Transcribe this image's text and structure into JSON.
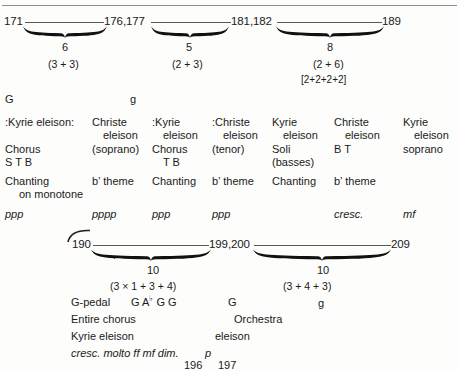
{
  "figure": {
    "type": "musical-form-analysis-chart",
    "top_rule": true
  },
  "system1": {
    "measure_numbers": [
      "171",
      "176,177",
      "181,182",
      "189"
    ],
    "groups": [
      {
        "count": "6",
        "subdivision": "(3 + 3)",
        "bracket": ""
      },
      {
        "count": "5",
        "subdivision": "(2 + 3)",
        "bracket": ""
      },
      {
        "count": "8",
        "subdivision": "(2 + 6)",
        "bracket": "[2+2+2+2]"
      }
    ],
    "keys": [
      "G",
      "g"
    ]
  },
  "table1": {
    "columns": [
      {
        "text": ":Kyrie eleison:",
        "text2": "",
        "voices": "Chorus",
        "voices2": "S T B",
        "technique": "Chanting",
        "technique2": "on monotone",
        "dynamic": "ppp"
      },
      {
        "text": "Christe",
        "text2": "eleison",
        "voices": "(soprano)",
        "voices2": "",
        "technique": "b’ theme",
        "technique2": "",
        "dynamic": "pppp"
      },
      {
        "text": ":Kyrie",
        "text2": "eleison",
        "voices": "Chorus",
        "voices2": "T B",
        "technique": "Chanting",
        "technique2": "",
        "dynamic": "ppp"
      },
      {
        "text": ":Christe",
        "text2": "eleison",
        "voices": "(tenor)",
        "voices2": "",
        "technique": "b’ theme",
        "technique2": "",
        "dynamic": "ppp"
      },
      {
        "text": "Kyrie",
        "text2": "eleison",
        "voices": "Soli",
        "voices2": "(basses)",
        "technique": "Chanting",
        "technique2": "",
        "dynamic": ""
      },
      {
        "text": "Christe",
        "text2": "eleison",
        "voices": "B T",
        "voices2": "",
        "technique": "b’ theme",
        "technique2": "",
        "dynamic": "cresc."
      },
      {
        "text": "Kyrie",
        "text2": "eleison",
        "voices": "soprano",
        "voices2": "",
        "technique": "",
        "technique2": "",
        "dynamic": "mf"
      }
    ]
  },
  "system2": {
    "measure_numbers": [
      "190",
      "199,200",
      "209"
    ],
    "groups": [
      {
        "count": "10",
        "subdivision": "(3 × 1 + 3 + 4)"
      },
      {
        "count": "10",
        "subdivision": "(3 + 4 + 3)"
      }
    ]
  },
  "table2": {
    "harmony_row": {
      "pedal": "G-pedal",
      "chords": "G A♭ G  G",
      "chord_root": "G",
      "chord_flat": "♭",
      "mid": "G",
      "right": "g"
    },
    "forces_row": {
      "left": "Entire chorus",
      "mid": "Orchestra"
    },
    "text_row": {
      "left": "Kyrie eleison",
      "mid": "eleison"
    },
    "dynamics_row": {
      "left": "cresc. molto ff mf dim.",
      "mid": "p"
    },
    "bar_numbers_row": {
      "first": "196",
      "second": "197"
    }
  }
}
